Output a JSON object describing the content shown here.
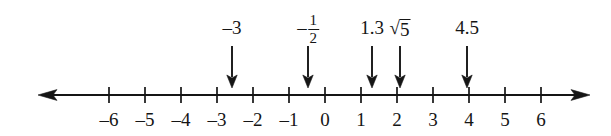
{
  "figure": {
    "kind": "number-line",
    "background_color": "#ffffff",
    "ink_color": "#151515"
  },
  "axis": {
    "min_tick": -6,
    "max_tick": 6,
    "tick_step": 1,
    "origin_x": 325,
    "pixels_per_unit": 36,
    "baseline_y": 95,
    "left_arrow_x": 38,
    "right_arrow_x": 590,
    "tick_half_height": 8,
    "left_arrow_icon": "arrow-left-icon",
    "right_arrow_icon": "arrow-right-icon",
    "tick_labels": [
      {
        "value": -6,
        "text": "–6"
      },
      {
        "value": -5,
        "text": "–5"
      },
      {
        "value": -4,
        "text": "–4"
      },
      {
        "value": -3,
        "text": "–3"
      },
      {
        "value": -2,
        "text": "–2"
      },
      {
        "value": -1,
        "text": "–1"
      },
      {
        "value": 0,
        "text": "0"
      },
      {
        "value": 1,
        "text": "1"
      },
      {
        "value": 2,
        "text": "2"
      },
      {
        "value": 3,
        "text": "3"
      },
      {
        "value": 4,
        "text": "4"
      },
      {
        "value": 5,
        "text": "5"
      },
      {
        "value": 6,
        "text": "6"
      }
    ]
  },
  "markers": [
    {
      "id": "marker-neg3",
      "label": "–3",
      "label_kind": "plain",
      "value": -3,
      "x": 232,
      "label_y": 18,
      "arrow_top_y": 46,
      "arrow_tip_y": 88
    },
    {
      "id": "marker-neg-one-half",
      "label": "–½",
      "label_kind": "fraction",
      "fraction": {
        "sign": "–",
        "numerator": "1",
        "denominator": "2"
      },
      "value": -0.5,
      "x": 308,
      "label_y": 12,
      "arrow_top_y": 46,
      "arrow_tip_y": 88
    },
    {
      "id": "marker-1-3",
      "label": "1.3",
      "label_kind": "plain",
      "value": 1.3,
      "x": 372,
      "label_y": 18,
      "arrow_top_y": 46,
      "arrow_tip_y": 88
    },
    {
      "id": "marker-sqrt5",
      "label": "√5",
      "label_kind": "radical",
      "radical": {
        "sign": "√",
        "radicand": "5"
      },
      "value": 2.236,
      "x": 400,
      "label_y": 18,
      "arrow_top_y": 46,
      "arrow_tip_y": 88
    },
    {
      "id": "marker-4-5",
      "label": "4.5",
      "label_kind": "plain",
      "value": 4.5,
      "x": 467,
      "label_y": 18,
      "arrow_top_y": 46,
      "arrow_tip_y": 88
    }
  ]
}
